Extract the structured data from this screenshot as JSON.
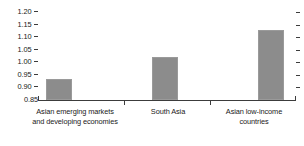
{
  "chart_data": {
    "type": "bar",
    "title": "",
    "subtitle": "",
    "xlabel": "",
    "ylabel": "",
    "categories": [
      "Asian emerging markets and developing economies",
      "South Asia",
      "Asian low-income countries"
    ],
    "category_lines": [
      [
        "Asian emerging markets",
        "and developing economies"
      ],
      [
        "South Asia"
      ],
      [
        "Asian low-income",
        "countries"
      ]
    ],
    "values": [
      0.935,
      1.02,
      1.13
    ],
    "ylim": [
      0.85,
      1.2
    ],
    "ytick_labels": [
      "1.20",
      "1.15",
      "1.10",
      "1.05",
      "1.00",
      "0.95",
      "0.90",
      "0.85"
    ],
    "ytick_values": [
      1.2,
      1.15,
      1.1,
      1.05,
      1.0,
      0.95,
      0.9,
      0.85
    ],
    "grid": false,
    "legend": "none",
    "bar_color": "#8c8c8c",
    "axis_color": "#3c3c3c",
    "text_color": "#1a1a1a",
    "background_color": "#ffffff"
  }
}
